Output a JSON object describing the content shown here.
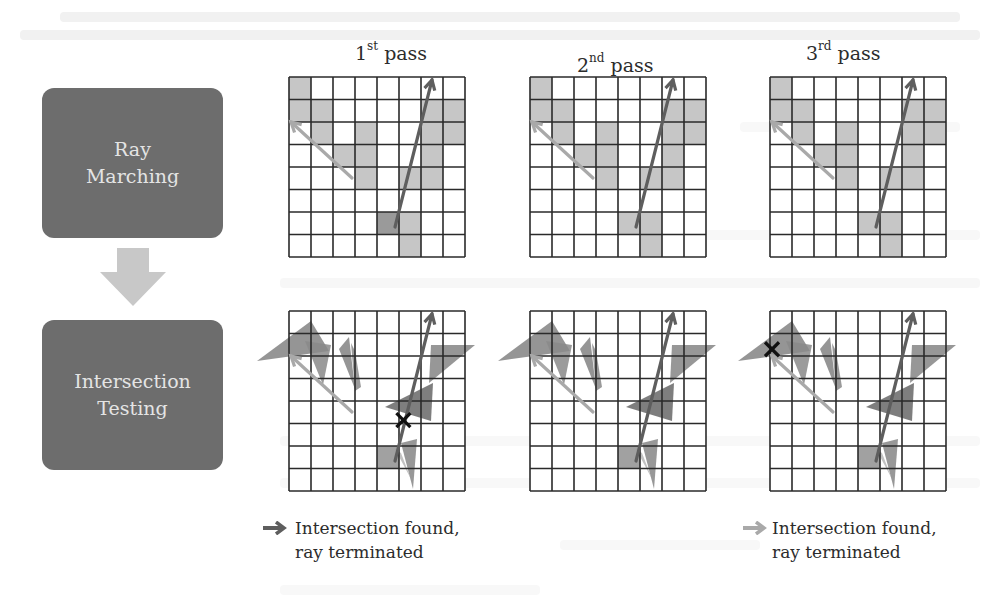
{
  "left_flow": {
    "top_box": {
      "line1": "Ray",
      "line2": "Marching"
    },
    "bottom_box": {
      "line1": "Intersection",
      "line2": "Testing"
    },
    "arrow_color": "#c8c8c8",
    "box_color": "#6d6d6d"
  },
  "passes": [
    {
      "ordinal": "1",
      "suffix": "st",
      "word": "pass",
      "hit_marker": {
        "row": 4,
        "col": 5
      },
      "start_cell_dark": true
    },
    {
      "ordinal": "2",
      "suffix": "nd",
      "word": "pass",
      "hit_marker": null,
      "start_cell_dark": false
    },
    {
      "ordinal": "3",
      "suffix": "rd",
      "word": "pass",
      "hit_marker": {
        "row": 1,
        "col": 0
      },
      "start_cell_dark": false
    }
  ],
  "grid": {
    "size": 8,
    "shaded_cells": [
      [
        0,
        0
      ],
      [
        1,
        0
      ],
      [
        1,
        1
      ],
      [
        1,
        6
      ],
      [
        1,
        7
      ],
      [
        2,
        1
      ],
      [
        2,
        3
      ],
      [
        2,
        6
      ],
      [
        2,
        7
      ],
      [
        3,
        2
      ],
      [
        3,
        3
      ],
      [
        3,
        6
      ],
      [
        4,
        3
      ],
      [
        4,
        5
      ],
      [
        4,
        6
      ],
      [
        6,
        4
      ],
      [
        6,
        5
      ],
      [
        7,
        5
      ]
    ],
    "shade_color": "#c6c6c6",
    "dark_shade_color": "#9a9a9a"
  },
  "rays": {
    "light_color": "#a9a9a9",
    "dark_color": "#5e5e5e"
  },
  "legends": [
    {
      "text_line1": "Intersection found,",
      "text_line2": "ray terminated",
      "arrow_color": "#5e5e5e"
    },
    {
      "text_line1": "Intersection found,",
      "text_line2": "ray terminated",
      "arrow_color": "#a9a9a9"
    }
  ]
}
